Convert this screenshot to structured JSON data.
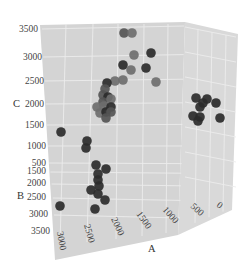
{
  "chart_data": {
    "type": "scatter3d",
    "title": "",
    "axes": {
      "x": {
        "label": "A",
        "ticks": [
          "0",
          "500",
          "1000",
          "1500",
          "2000",
          "2500",
          "3000"
        ]
      },
      "y": {
        "label": "B",
        "ticks": [
          "500",
          "1500",
          "2000",
          "2500",
          "3000",
          "3500"
        ]
      },
      "z": {
        "label": "C",
        "ticks": [
          "1000",
          "1500",
          "2000",
          "2500",
          "3000",
          "3500"
        ]
      }
    },
    "grid": true,
    "colors": {
      "pane": "#d6d6d6",
      "grid": "#ebebeb",
      "dark_point": "#2b2b2b",
      "mid_point": "#555555",
      "light_point": "#6e6e6e"
    },
    "points_screen": [
      {
        "x": 124,
        "y": 33,
        "shade": "mid"
      },
      {
        "x": 132,
        "y": 33,
        "shade": "light"
      },
      {
        "x": 134,
        "y": 55,
        "shade": "light"
      },
      {
        "x": 151,
        "y": 53,
        "shade": "dark"
      },
      {
        "x": 123,
        "y": 65,
        "shade": "dark"
      },
      {
        "x": 131,
        "y": 70,
        "shade": "light"
      },
      {
        "x": 146,
        "y": 68,
        "shade": "dark"
      },
      {
        "x": 156,
        "y": 82,
        "shade": "light"
      },
      {
        "x": 115,
        "y": 81,
        "shade": "light"
      },
      {
        "x": 123,
        "y": 80,
        "shade": "light"
      },
      {
        "x": 107,
        "y": 83,
        "shade": "dark"
      },
      {
        "x": 105,
        "y": 89,
        "shade": "mid"
      },
      {
        "x": 103,
        "y": 95,
        "shade": "mid"
      },
      {
        "x": 108,
        "y": 97,
        "shade": "dark"
      },
      {
        "x": 103,
        "y": 102,
        "shade": "mid"
      },
      {
        "x": 111,
        "y": 99,
        "shade": "light"
      },
      {
        "x": 97,
        "y": 107,
        "shade": "light"
      },
      {
        "x": 104,
        "y": 106,
        "shade": "light"
      },
      {
        "x": 111,
        "y": 107,
        "shade": "dark"
      },
      {
        "x": 100,
        "y": 113,
        "shade": "light"
      },
      {
        "x": 106,
        "y": 112,
        "shade": "dark"
      },
      {
        "x": 111,
        "y": 112,
        "shade": "mid"
      },
      {
        "x": 106,
        "y": 118,
        "shade": "mid"
      },
      {
        "x": 61,
        "y": 132,
        "shade": "dark"
      },
      {
        "x": 87,
        "y": 141,
        "shade": "dark"
      },
      {
        "x": 86,
        "y": 148,
        "shade": "dark"
      },
      {
        "x": 96,
        "y": 165,
        "shade": "dark"
      },
      {
        "x": 106,
        "y": 169,
        "shade": "dark"
      },
      {
        "x": 98,
        "y": 174,
        "shade": "dark"
      },
      {
        "x": 98,
        "y": 180,
        "shade": "dark"
      },
      {
        "x": 99,
        "y": 186,
        "shade": "dark"
      },
      {
        "x": 91,
        "y": 190,
        "shade": "dark"
      },
      {
        "x": 98,
        "y": 194,
        "shade": "dark"
      },
      {
        "x": 105,
        "y": 200,
        "shade": "dark"
      },
      {
        "x": 60,
        "y": 206,
        "shade": "dark"
      },
      {
        "x": 95,
        "y": 209,
        "shade": "dark"
      },
      {
        "x": 196,
        "y": 98,
        "shade": "dark"
      },
      {
        "x": 207,
        "y": 99,
        "shade": "dark"
      },
      {
        "x": 203,
        "y": 103,
        "shade": "dark"
      },
      {
        "x": 200,
        "y": 107,
        "shade": "dark"
      },
      {
        "x": 216,
        "y": 103,
        "shade": "dark"
      },
      {
        "x": 193,
        "y": 116,
        "shade": "dark"
      },
      {
        "x": 200,
        "y": 117,
        "shade": "dark"
      },
      {
        "x": 198,
        "y": 121,
        "shade": "dark"
      },
      {
        "x": 220,
        "y": 118,
        "shade": "dark"
      }
    ]
  },
  "labels": {
    "z_axis": "C",
    "y_axis": "B",
    "x_axis": "A",
    "z_ticks": [
      "3500",
      "3000",
      "2500",
      "2000",
      "1500",
      "1000"
    ],
    "y_ticks": [
      "500",
      "1500",
      "2000",
      "2500",
      "3000",
      "3500"
    ],
    "x_ticks": [
      "3000",
      "2500",
      "2000",
      "1500",
      "1000",
      "500",
      "0"
    ]
  }
}
